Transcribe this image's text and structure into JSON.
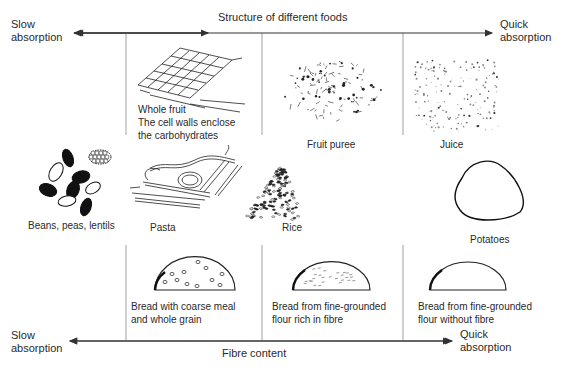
{
  "top_axis": {
    "title": "Structure of different foods",
    "left_label_line1": "Slow",
    "left_label_line2": "absorption",
    "right_label_line1": "Quick",
    "right_label_line2": "absorption"
  },
  "bottom_axis": {
    "title": "Fibre content",
    "left_label_line1": "Slow",
    "left_label_line2": "absorption",
    "right_label_line1": "Quick",
    "right_label_line2": "absorption"
  },
  "top_row": [
    {
      "icon": "whole-fruit-grid-icon",
      "line1": "Whole fruit",
      "line2": "The cell walls enclose",
      "line3": "the carbohydrates"
    },
    {
      "icon": "fruit-puree-icon",
      "line1": "Fruit puree"
    },
    {
      "icon": "juice-icon",
      "line1": "Juice"
    }
  ],
  "middle_row": [
    {
      "icon": "beans-icon",
      "label": "Beans, peas, lentils"
    },
    {
      "icon": "pasta-icon",
      "label": "Pasta"
    },
    {
      "icon": "rice-icon",
      "label": "Rice"
    },
    {
      "icon": "potato-icon",
      "label": "Potatoes"
    }
  ],
  "bottom_row": [
    {
      "icon": "coarse-bread-icon",
      "line1": "Bread with coarse meal",
      "line2": "and whole grain"
    },
    {
      "icon": "fibre-bread-icon",
      "line1": "Bread from fine-grounded",
      "line2": "flour rich in fibre"
    },
    {
      "icon": "white-bread-icon",
      "line1": "Bread from fine-grounded",
      "line2": "flour without fibre"
    }
  ],
  "colors": {
    "line": "#3a3a3a",
    "ink": "#1e1e1e"
  }
}
